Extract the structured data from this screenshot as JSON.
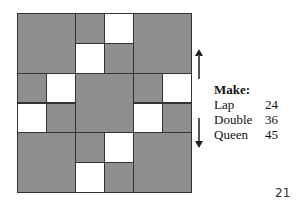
{
  "legend": {
    "title": "Make:",
    "items": [
      {
        "label": "Lap",
        "value": "24"
      },
      {
        "label": "Double",
        "value": "36"
      },
      {
        "label": "Queen",
        "value": "45"
      }
    ]
  },
  "page_number": "21",
  "colors": {
    "dark": "#8f8f8f",
    "light": "#ffffff",
    "border": "#333333"
  },
  "quilt_grid": {
    "units": 6,
    "cells": [
      {
        "x": 0,
        "y": 0,
        "w": 2,
        "h": 2,
        "c": "dark"
      },
      {
        "x": 2,
        "y": 0,
        "w": 1,
        "h": 1,
        "c": "dark"
      },
      {
        "x": 3,
        "y": 0,
        "w": 1,
        "h": 1,
        "c": "light"
      },
      {
        "x": 2,
        "y": 1,
        "w": 1,
        "h": 1,
        "c": "light"
      },
      {
        "x": 3,
        "y": 1,
        "w": 1,
        "h": 1,
        "c": "dark"
      },
      {
        "x": 4,
        "y": 0,
        "w": 2,
        "h": 2,
        "c": "dark"
      },
      {
        "x": 0,
        "y": 2,
        "w": 1,
        "h": 1,
        "c": "dark"
      },
      {
        "x": 1,
        "y": 2,
        "w": 1,
        "h": 1,
        "c": "light"
      },
      {
        "x": 0,
        "y": 3,
        "w": 1,
        "h": 1,
        "c": "light"
      },
      {
        "x": 1,
        "y": 3,
        "w": 1,
        "h": 1,
        "c": "dark"
      },
      {
        "x": 2,
        "y": 2,
        "w": 2,
        "h": 2,
        "c": "dark"
      },
      {
        "x": 4,
        "y": 2,
        "w": 1,
        "h": 1,
        "c": "dark"
      },
      {
        "x": 5,
        "y": 2,
        "w": 1,
        "h": 1,
        "c": "light"
      },
      {
        "x": 4,
        "y": 3,
        "w": 1,
        "h": 1,
        "c": "light"
      },
      {
        "x": 5,
        "y": 3,
        "w": 1,
        "h": 1,
        "c": "dark"
      },
      {
        "x": 0,
        "y": 4,
        "w": 2,
        "h": 2,
        "c": "dark"
      },
      {
        "x": 2,
        "y": 4,
        "w": 1,
        "h": 1,
        "c": "dark"
      },
      {
        "x": 3,
        "y": 4,
        "w": 1,
        "h": 1,
        "c": "light"
      },
      {
        "x": 2,
        "y": 5,
        "w": 1,
        "h": 1,
        "c": "light"
      },
      {
        "x": 3,
        "y": 5,
        "w": 1,
        "h": 1,
        "c": "dark"
      },
      {
        "x": 4,
        "y": 4,
        "w": 2,
        "h": 2,
        "c": "dark"
      }
    ]
  }
}
